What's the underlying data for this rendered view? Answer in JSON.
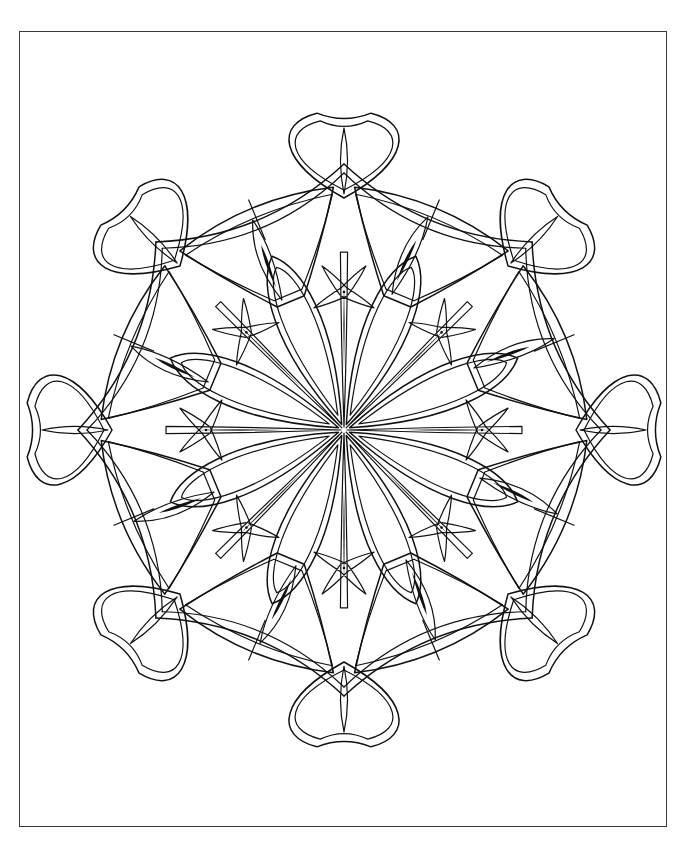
{
  "page": {
    "background_color": "#ffffff",
    "width": 688,
    "height": 853
  },
  "frame": {
    "name": "page-border",
    "stroke_color": "#3a3a3a",
    "x": 19,
    "y": 31,
    "width": 648,
    "height": 796
  },
  "artwork": {
    "type": "line-art-mandala",
    "description": "Eight-fold symmetric snowflake mandala coloring outline",
    "stroke_color": "#111111",
    "fill_color": "#ffffff",
    "center_x": 344,
    "center_y": 430,
    "symmetry": 8,
    "outer_radius": 318,
    "rings": [
      {
        "name": "center-star",
        "label": "Central eight point star junction",
        "radius": 0
      },
      {
        "name": "inner-petal-ring",
        "label": "Eight elongated leaf petals",
        "radius": 120
      },
      {
        "name": "starfish-ring",
        "label": "Eight small four-point starfish accents",
        "radius": 128
      },
      {
        "name": "mid-wedge-ring",
        "label": "Eight triangular fan wedges",
        "radius": 215
      },
      {
        "name": "outer-heart-ring",
        "label": "Eight outer heart teardrop petals",
        "radius": 285
      }
    ]
  },
  "geometry": {
    "center": [
      344,
      430
    ],
    "spoke_angles_deg": [
      0,
      45,
      90,
      135,
      180,
      225,
      270,
      315
    ],
    "inner_petal": {
      "tip_radius": 178,
      "half_width": 34,
      "accent_line_start": 60,
      "accent_line_end": 150
    },
    "starfish": {
      "ring_radius": 138,
      "arm_length": 34,
      "arm_width": 5
    },
    "mid_wedge": {
      "inner_radius": 140,
      "outer_radius": 243,
      "half_angle_deg": 20
    },
    "outer_heart": {
      "ring_radius": 282,
      "lobe_radius": 44
    },
    "outer_ring_curve_radius": 250
  }
}
